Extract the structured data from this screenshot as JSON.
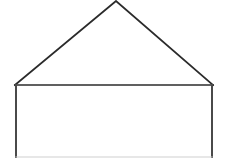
{
  "canvas": {
    "width": 228,
    "height": 161,
    "background_color": "#ffffff",
    "title": "House shape line drawing"
  },
  "drawing": {
    "figure_name": "house-pentagon-outline",
    "description": "Simple black outline drawing of a house shape: an isosceles triangle roof resting on a wide rectangle body.",
    "stroke_color": "#2b2b2b",
    "stroke_color_light": "#cfcfcf",
    "fill_color": "none",
    "stroke_width": 1.6,
    "shapes": [
      {
        "name": "roof-triangle",
        "type": "polyline",
        "points": "15,85 116,1 213,85",
        "stroke": "#2b2b2b",
        "stroke_width": 1.8,
        "fill": "none"
      },
      {
        "name": "roof-base-line",
        "type": "line",
        "x1": 15,
        "y1": 85,
        "x2": 213,
        "y2": 85,
        "stroke": "#2b2b2b",
        "stroke_width": 1.6
      },
      {
        "name": "body-left-wall",
        "type": "line",
        "x1": 16,
        "y1": 85,
        "x2": 16,
        "y2": 157,
        "stroke": "#4a4a4a",
        "stroke_width": 2.0
      },
      {
        "name": "body-right-wall",
        "type": "line",
        "x1": 212,
        "y1": 85,
        "x2": 212,
        "y2": 157,
        "stroke": "#4a4a4a",
        "stroke_width": 2.0
      },
      {
        "name": "body-bottom-edge",
        "type": "line",
        "x1": 16,
        "y1": 157,
        "x2": 212,
        "y2": 157,
        "stroke": "#cfcfcf",
        "stroke_width": 1.2
      }
    ],
    "vertices": [
      {
        "name": "apex",
        "x": 116,
        "y": 1
      },
      {
        "name": "roof-left-eave",
        "x": 15,
        "y": 85
      },
      {
        "name": "roof-right-eave",
        "x": 213,
        "y": 85
      },
      {
        "name": "body-bottom-left",
        "x": 16,
        "y": 157
      },
      {
        "name": "body-bottom-right",
        "x": 212,
        "y": 157
      }
    ]
  }
}
